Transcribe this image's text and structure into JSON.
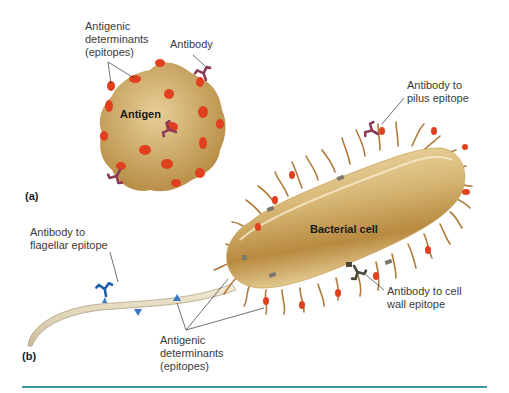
{
  "panel_a": {
    "label": "(a)",
    "antigen_label": "Antigen",
    "epitope_label_lines": [
      "Antigenic",
      "determinants",
      "(epitopes)"
    ],
    "antibody_label": "Antibody"
  },
  "panel_b": {
    "label": "(b)",
    "cell_label": "Bacterial cell",
    "pilus_antibody_lines": [
      "Antibody to",
      "pilus epitope"
    ],
    "flagellar_antibody_lines": [
      "Antibody to",
      "flagellar epitope"
    ],
    "cell_wall_antibody_lines": [
      "Antibody to cell",
      "wall epitope"
    ],
    "epitope_label_lines": [
      "Antigenic",
      "determinants",
      "(epitopes)"
    ]
  },
  "colors": {
    "antigen_body": "#c9a45c",
    "epitope_red": "#e0401e",
    "antibody_purple": "#8a3a55",
    "flagellar_antibody_blue": "#1f5fa8",
    "cell_wall_antibody": "#4a4a3a",
    "pilus": "#b07a3a",
    "bottom_rule": "#3a9aa0"
  }
}
